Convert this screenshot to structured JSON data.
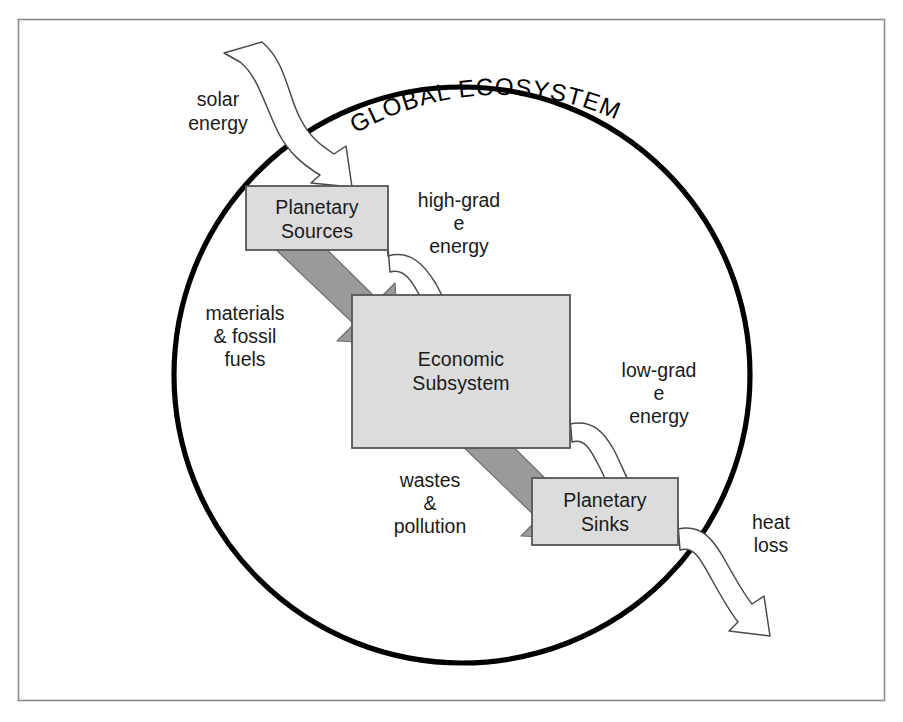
{
  "figure": {
    "title": "GLOBAL ECOSYSTEM",
    "caption": "",
    "type": "conceptual-flow-diagram",
    "colors": {
      "box_fill": "#dcdcdc",
      "box_stroke": "#555555",
      "circle_stroke": "#000000",
      "material_arrow_fill": "#9a9a9a",
      "energy_arrow_fill": "#ffffff",
      "frame_stroke": "#8b8b8b",
      "text": "#1a1a1a"
    }
  },
  "boxes": [
    {
      "id": "planetary-sources",
      "line1": "Planetary",
      "line2": "Sources",
      "x": 246,
      "y": 186,
      "w": 142,
      "h": 64
    },
    {
      "id": "economic-subsystem",
      "line1": "Economic",
      "line2": "Subsystem",
      "x": 352,
      "y": 295,
      "w": 218,
      "h": 153
    },
    {
      "id": "planetary-sinks",
      "line1": "Planetary",
      "line2": "Sinks",
      "x": 532,
      "y": 478,
      "w": 146,
      "h": 67
    }
  ],
  "flows": [
    {
      "id": "solar-energy",
      "kind": "energy",
      "label_lines": [
        "solar",
        "energy"
      ],
      "from": "outside",
      "to": "planetary-sources",
      "label_x": 218,
      "label_y": 100
    },
    {
      "id": "high-grade-energy",
      "kind": "energy",
      "label_lines": [
        "high-grad",
        "e",
        "energy"
      ],
      "from": "planetary-sources",
      "to": "economic-subsystem",
      "label_x": 459,
      "label_y": 205
    },
    {
      "id": "materials-fossil-fuels",
      "kind": "material",
      "label_lines": [
        "materials",
        "& fossil",
        "fuels"
      ],
      "from": "planetary-sources",
      "to": "economic-subsystem",
      "label_x": 245,
      "label_y": 318
    },
    {
      "id": "low-grade-energy",
      "kind": "energy",
      "label_lines": [
        "low-grad",
        "e",
        "energy"
      ],
      "from": "economic-subsystem",
      "to": "planetary-sinks",
      "label_x": 659,
      "label_y": 375
    },
    {
      "id": "wastes-pollution",
      "kind": "material",
      "label_lines": [
        "wastes",
        "&",
        "pollution"
      ],
      "from": "economic-subsystem",
      "to": "planetary-sinks",
      "label_x": 430,
      "label_y": 485
    },
    {
      "id": "heat-loss",
      "kind": "energy",
      "label_lines": [
        "heat",
        "loss"
      ],
      "from": "planetary-sinks",
      "to": "outside",
      "label_x": 771,
      "label_y": 527
    }
  ],
  "circle": {
    "cx": 462,
    "cy": 375,
    "r": 288
  }
}
